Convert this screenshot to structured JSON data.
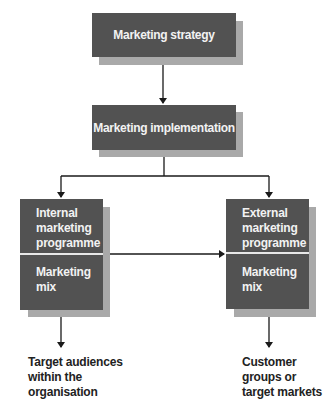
{
  "diagram": {
    "nodes": {
      "strategy": {
        "label": "Marketing strategy"
      },
      "implementation": {
        "label": "Marketing implementation"
      },
      "internal": {
        "programme_lines": [
          "Internal",
          "marketing",
          "programme"
        ],
        "mix_lines": [
          "Marketing",
          "mix"
        ]
      },
      "external": {
        "programme_lines": [
          "External",
          "marketing",
          "programme"
        ],
        "mix_lines": [
          "Marketing",
          "mix"
        ]
      }
    },
    "outputs": {
      "internal": {
        "lines": [
          "Target audiences",
          "within the",
          "organisation"
        ]
      },
      "external": {
        "lines": [
          "Customer",
          "groups or",
          "target markets"
        ]
      }
    },
    "colors": {
      "box_fill": "#525252",
      "box_shadow": "#a9a9a9",
      "box_text": "#f2f2f2",
      "line": "#1a1a1a"
    }
  }
}
